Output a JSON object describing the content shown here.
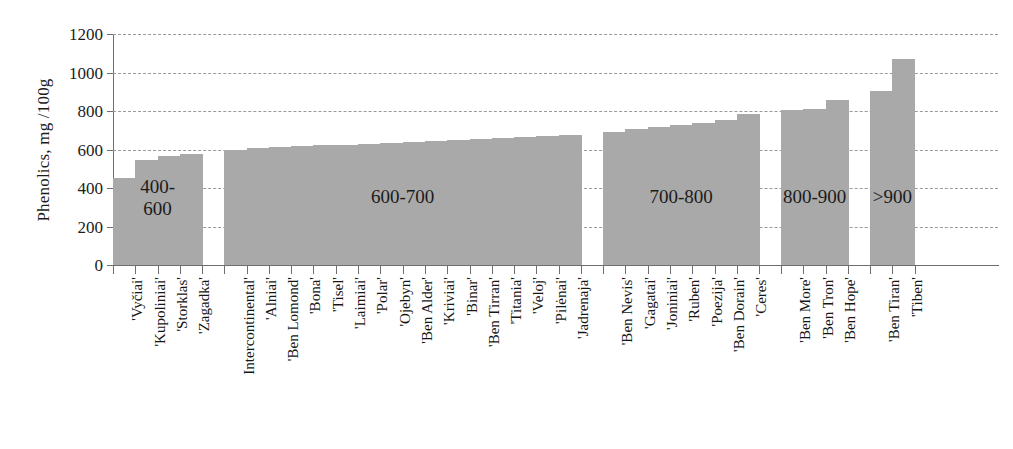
{
  "chart_data": {
    "type": "bar",
    "title": "",
    "xlabel": "",
    "ylabel": "Phenolics, mg /100g",
    "ylim": [
      0,
      1200
    ],
    "ytick_step": 200,
    "yticks": [
      0,
      200,
      400,
      600,
      800,
      1000,
      1200
    ],
    "grid": true,
    "legend": "none",
    "bar_color": "#a9a9a9",
    "categories": [
      "'Vyčiai'",
      "'Kupoliniai'",
      "'Storklas'",
      "'Zagadka'",
      "Intercontinental'",
      "'Alniai'",
      "'Ben Lomond'",
      "'Bona'",
      "'Tisel'",
      "'Laimiai'",
      "'Polar'",
      "'Ojebyn'",
      "'Ben Alder'",
      "'Kriviai'",
      "'Binar'",
      "'Ben Tirran'",
      "'Titania'",
      "'Veloj'",
      "'Pilėnai'",
      "'Jadrenaja'",
      "'Ben Nevis'",
      "'Gagatai'",
      "'Joniniai'",
      "'Ruben'",
      "'Poezija'",
      "'Ben Dorain'",
      "'Ceres'",
      "'Ben More'",
      "'Ben Tron'",
      "'Ben Hope'",
      "'Ben Tiran'",
      "'Tiben'"
    ],
    "values": [
      450,
      545,
      568,
      578,
      598,
      608,
      615,
      620,
      622,
      624,
      628,
      632,
      638,
      643,
      648,
      654,
      660,
      664,
      670,
      674,
      690,
      706,
      715,
      726,
      740,
      752,
      785,
      805,
      808,
      858,
      905,
      1070
    ],
    "groups": [
      {
        "label": "400-\n600",
        "range": "400-600",
        "start_index": 0,
        "count": 4
      },
      {
        "label": "600-700",
        "range": "600-700",
        "start_index": 4,
        "count": 16
      },
      {
        "label": "700-800",
        "range": "700-800",
        "start_index": 20,
        "count": 7
      },
      {
        "label": "800-900",
        "range": "800-900",
        "start_index": 27,
        "count": 3
      },
      {
        "label": ">900",
        "range": ">900",
        "start_index": 30,
        "count": 2
      }
    ]
  },
  "axis": {
    "y_title": "Phenolics, mg /100g",
    "y_labels": [
      "1200",
      "1000",
      "800",
      "600",
      "400",
      "200",
      "0"
    ]
  },
  "captions": {
    "g0": "400-\n600",
    "g1": "600-700",
    "g2": "700-800",
    "g3": "800-900",
    "g4": ">900"
  }
}
